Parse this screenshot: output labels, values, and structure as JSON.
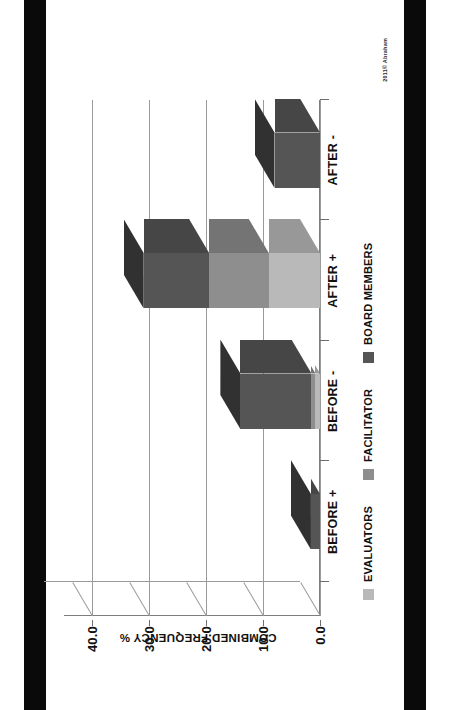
{
  "page": {
    "background": "#ffffff",
    "scan_band_color": "#0a0a0a"
  },
  "watermark": "2011© Abraham",
  "chart_data": {
    "type": "bar",
    "subtype": "stacked-3d-column",
    "title": "",
    "xlabel": "",
    "ylabel": "COMBINED FREQUENCY %",
    "categories": [
      "BEFORE +",
      "BEFORE -",
      "AFTER +",
      "AFTER -"
    ],
    "series": [
      {
        "name": "EVALUATORS",
        "color": "#b9b9b9",
        "values": [
          0.0,
          0.8,
          9.0,
          0.0
        ]
      },
      {
        "name": "FACILITATOR",
        "color": "#8e8e8e",
        "values": [
          0.0,
          0.7,
          10.5,
          0.0
        ]
      },
      {
        "name": "BOARD MEMBERS",
        "color": "#555555",
        "values": [
          1.6,
          12.5,
          11.5,
          8.0
        ]
      }
    ],
    "totals": [
      1.6,
      14.0,
      31.0,
      8.0
    ],
    "yticks": [
      "0.0",
      "10.0",
      "20.0",
      "30.0",
      "40.0"
    ],
    "ytick_values": [
      0,
      10,
      20,
      30,
      40
    ],
    "ylim": [
      0,
      45
    ],
    "grid": true,
    "legend_position": "bottom"
  },
  "legend": {
    "items": [
      {
        "label": "EVALUATORS",
        "color": "#b9b9b9"
      },
      {
        "label": "FACILITATOR",
        "color": "#8e8e8e"
      },
      {
        "label": "BOARD MEMBERS",
        "color": "#555555"
      }
    ]
  },
  "axis": {
    "value_title": "COMBINED FREQUENCY %",
    "ticks": [
      "0.0",
      "10.0",
      "20.0",
      "30.0",
      "40.0"
    ]
  },
  "categories": [
    "BEFORE +",
    "BEFORE -",
    "AFTER +",
    "AFTER -"
  ]
}
